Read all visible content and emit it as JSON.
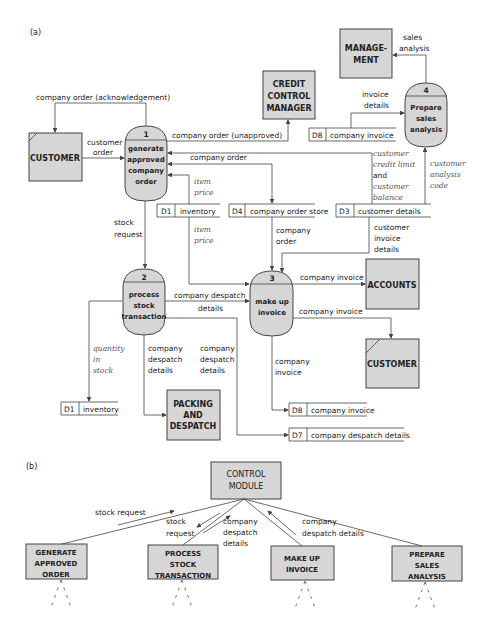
{
  "panel_a": {
    "label": "(a)",
    "entities": {
      "customer_left": "CUSTOMER",
      "credit_control": [
        "CREDIT",
        "CONTROL",
        "MANAGER"
      ],
      "management": [
        "MANAGE-",
        "MENT"
      ],
      "accounts": "ACCOUNTS",
      "customer_right": "CUSTOMER",
      "packing": [
        "PACKING",
        "AND",
        "DESPATCH"
      ]
    },
    "processes": [
      {
        "num": "1",
        "lines": [
          "generate",
          "approved",
          "company",
          "order"
        ]
      },
      {
        "num": "2",
        "lines": [
          "process",
          "stock",
          "transaction"
        ]
      },
      {
        "num": "3",
        "lines": [
          "make up",
          "invoice"
        ]
      },
      {
        "num": "4",
        "lines": [
          "Prepare",
          "sales",
          "analysis"
        ]
      }
    ],
    "stores": [
      {
        "id": "D8",
        "name": "company invoice"
      },
      {
        "id": "D1",
        "name": "inventory"
      },
      {
        "id": "D4",
        "name": "company order store"
      },
      {
        "id": "D3",
        "name": "customer details"
      },
      {
        "id": "D1",
        "name": "inventory"
      },
      {
        "id": "D8",
        "name": "company invoice"
      },
      {
        "id": "D7",
        "name": "company despatch details"
      }
    ],
    "flows": {
      "ack": "company order (acknowledgement)",
      "customer_order": [
        "customer",
        "order"
      ],
      "unapproved": "company order (unapproved)",
      "company_order": "company order",
      "item_price_1": [
        "item",
        "price"
      ],
      "item_price_2": [
        "item",
        "price"
      ],
      "stock_request": [
        "stock",
        "request"
      ],
      "credit_limit": [
        "customer",
        "credit limit",
        "and",
        "customer",
        "balance"
      ],
      "analysis_code": [
        "customer",
        "analysis",
        "code"
      ],
      "invoice_details": [
        "invoice",
        "details"
      ],
      "sales_analysis": [
        "sales",
        "analysis"
      ],
      "company_order_2": [
        "company",
        "order"
      ],
      "customer_invoice_details": [
        "customer",
        "invoice",
        "details"
      ],
      "company_despatch": [
        "company despatch",
        "details"
      ],
      "company_invoice_accounts": "company invoice",
      "company_invoice_customer": "company invoice",
      "company_invoice_store": [
        "company",
        "invoice"
      ],
      "quantity_in_stock": [
        "quantity",
        "in",
        "stock"
      ],
      "despatch_details_1": [
        "company",
        "despatch",
        "details"
      ],
      "despatch_details_2": [
        "company",
        "despatch",
        "details"
      ]
    }
  },
  "panel_b": {
    "label": "(b)",
    "control": [
      "CONTROL",
      "MODULE"
    ],
    "modules": [
      [
        "GENERATE",
        "APPROVED",
        "ORDER"
      ],
      [
        "PROCESS",
        "STOCK",
        "TRANSACTION"
      ],
      [
        "MAKE UP",
        "INVOICE"
      ],
      [
        "PREPARE",
        "SALES",
        "ANALYSIS"
      ]
    ],
    "flows": {
      "stock_request_1": "stock request",
      "stock_request_2": [
        "stock",
        "request"
      ],
      "despatch_1": [
        "company",
        "despatch",
        "details"
      ],
      "despatch_2": [
        "company",
        "despatch details"
      ]
    }
  }
}
